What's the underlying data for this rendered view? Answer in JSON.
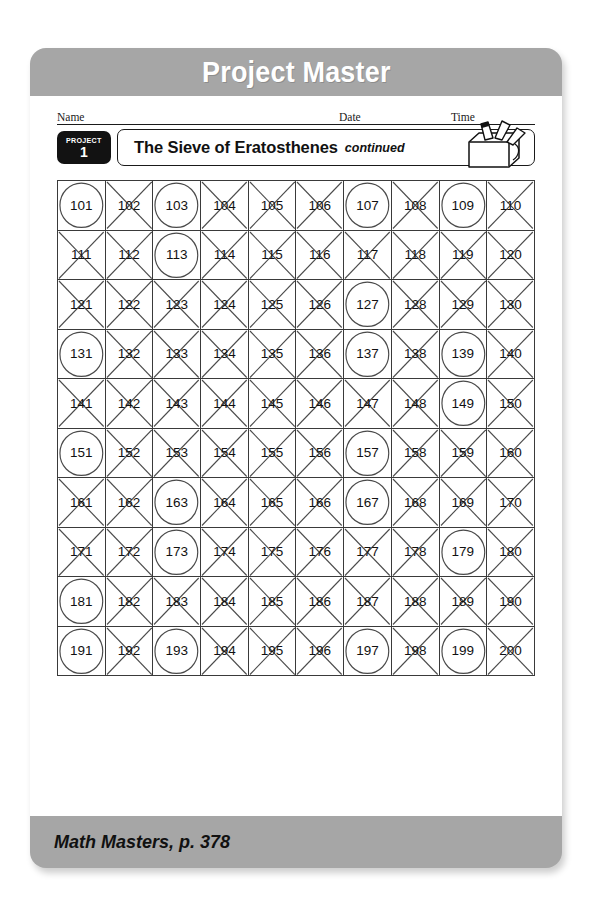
{
  "banner": {
    "title": "Project Master"
  },
  "id_row": {
    "name_label": "Name",
    "date_label": "Date",
    "time_label": "Time"
  },
  "project_header": {
    "badge_label": "PROJECT",
    "badge_number": "1",
    "title": "The Sieve of Eratosthenes",
    "continued": "continued",
    "icon": "math-toolbox-icon"
  },
  "footer": {
    "text": "Math Masters, p. 378"
  },
  "colors": {
    "card_gray": "#a6a6a6",
    "banner_text": "#ffffff",
    "ink": "#111111",
    "mark": "#4a4a4a"
  },
  "grid": {
    "columns": 10,
    "rows": 10,
    "start": 101,
    "end": 200,
    "circled_legend": "prime (circled)",
    "crossed_legend": "composite (crossed out)",
    "rows_data": [
      [
        {
          "n": "101",
          "mark": "circle"
        },
        {
          "n": "102",
          "mark": "cross"
        },
        {
          "n": "103",
          "mark": "circle"
        },
        {
          "n": "104",
          "mark": "cross"
        },
        {
          "n": "105",
          "mark": "cross"
        },
        {
          "n": "106",
          "mark": "cross"
        },
        {
          "n": "107",
          "mark": "circle"
        },
        {
          "n": "108",
          "mark": "cross"
        },
        {
          "n": "109",
          "mark": "circle"
        },
        {
          "n": "110",
          "mark": "cross"
        }
      ],
      [
        {
          "n": "111",
          "mark": "cross"
        },
        {
          "n": "112",
          "mark": "cross"
        },
        {
          "n": "113",
          "mark": "circle"
        },
        {
          "n": "114",
          "mark": "cross"
        },
        {
          "n": "115",
          "mark": "cross"
        },
        {
          "n": "116",
          "mark": "cross"
        },
        {
          "n": "117",
          "mark": "cross"
        },
        {
          "n": "118",
          "mark": "cross"
        },
        {
          "n": "119",
          "mark": "cross"
        },
        {
          "n": "120",
          "mark": "cross"
        }
      ],
      [
        {
          "n": "121",
          "mark": "cross"
        },
        {
          "n": "122",
          "mark": "cross"
        },
        {
          "n": "123",
          "mark": "cross"
        },
        {
          "n": "124",
          "mark": "cross"
        },
        {
          "n": "125",
          "mark": "cross"
        },
        {
          "n": "126",
          "mark": "cross"
        },
        {
          "n": "127",
          "mark": "circle"
        },
        {
          "n": "128",
          "mark": "cross"
        },
        {
          "n": "129",
          "mark": "cross"
        },
        {
          "n": "130",
          "mark": "cross"
        }
      ],
      [
        {
          "n": "131",
          "mark": "circle"
        },
        {
          "n": "132",
          "mark": "cross"
        },
        {
          "n": "133",
          "mark": "cross"
        },
        {
          "n": "134",
          "mark": "cross"
        },
        {
          "n": "135",
          "mark": "cross"
        },
        {
          "n": "136",
          "mark": "cross"
        },
        {
          "n": "137",
          "mark": "circle"
        },
        {
          "n": "138",
          "mark": "cross"
        },
        {
          "n": "139",
          "mark": "circle"
        },
        {
          "n": "140",
          "mark": "cross"
        }
      ],
      [
        {
          "n": "141",
          "mark": "cross"
        },
        {
          "n": "142",
          "mark": "cross"
        },
        {
          "n": "143",
          "mark": "cross"
        },
        {
          "n": "144",
          "mark": "cross"
        },
        {
          "n": "145",
          "mark": "cross"
        },
        {
          "n": "146",
          "mark": "cross"
        },
        {
          "n": "147",
          "mark": "cross"
        },
        {
          "n": "148",
          "mark": "cross"
        },
        {
          "n": "149",
          "mark": "circle"
        },
        {
          "n": "150",
          "mark": "cross"
        }
      ],
      [
        {
          "n": "151",
          "mark": "circle"
        },
        {
          "n": "152",
          "mark": "cross"
        },
        {
          "n": "153",
          "mark": "cross"
        },
        {
          "n": "154",
          "mark": "cross"
        },
        {
          "n": "155",
          "mark": "cross"
        },
        {
          "n": "156",
          "mark": "cross"
        },
        {
          "n": "157",
          "mark": "circle"
        },
        {
          "n": "158",
          "mark": "cross"
        },
        {
          "n": "159",
          "mark": "cross"
        },
        {
          "n": "160",
          "mark": "cross"
        }
      ],
      [
        {
          "n": "161",
          "mark": "cross"
        },
        {
          "n": "162",
          "mark": "cross"
        },
        {
          "n": "163",
          "mark": "circle"
        },
        {
          "n": "164",
          "mark": "cross"
        },
        {
          "n": "165",
          "mark": "cross"
        },
        {
          "n": "166",
          "mark": "cross"
        },
        {
          "n": "167",
          "mark": "circle"
        },
        {
          "n": "168",
          "mark": "cross"
        },
        {
          "n": "169",
          "mark": "cross"
        },
        {
          "n": "170",
          "mark": "cross"
        }
      ],
      [
        {
          "n": "171",
          "mark": "cross"
        },
        {
          "n": "172",
          "mark": "cross"
        },
        {
          "n": "173",
          "mark": "circle"
        },
        {
          "n": "174",
          "mark": "cross"
        },
        {
          "n": "175",
          "mark": "cross"
        },
        {
          "n": "176",
          "mark": "cross"
        },
        {
          "n": "177",
          "mark": "cross"
        },
        {
          "n": "178",
          "mark": "cross"
        },
        {
          "n": "179",
          "mark": "circle"
        },
        {
          "n": "180",
          "mark": "cross"
        }
      ],
      [
        {
          "n": "181",
          "mark": "circle"
        },
        {
          "n": "182",
          "mark": "cross"
        },
        {
          "n": "183",
          "mark": "cross"
        },
        {
          "n": "184",
          "mark": "cross"
        },
        {
          "n": "185",
          "mark": "cross"
        },
        {
          "n": "186",
          "mark": "cross"
        },
        {
          "n": "187",
          "mark": "cross"
        },
        {
          "n": "188",
          "mark": "cross"
        },
        {
          "n": "189",
          "mark": "cross"
        },
        {
          "n": "190",
          "mark": "cross"
        }
      ],
      [
        {
          "n": "191",
          "mark": "circle"
        },
        {
          "n": "192",
          "mark": "cross"
        },
        {
          "n": "193",
          "mark": "circle"
        },
        {
          "n": "194",
          "mark": "cross"
        },
        {
          "n": "195",
          "mark": "cross"
        },
        {
          "n": "196",
          "mark": "cross"
        },
        {
          "n": "197",
          "mark": "circle"
        },
        {
          "n": "198",
          "mark": "cross"
        },
        {
          "n": "199",
          "mark": "circle"
        },
        {
          "n": "200",
          "mark": "cross"
        }
      ]
    ]
  }
}
